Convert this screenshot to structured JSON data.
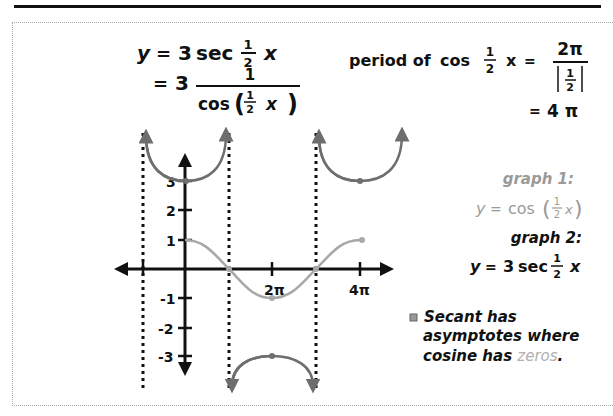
{
  "equations": {
    "main_line1": {
      "lhs": "y",
      "eq": "=",
      "coef": "3",
      "func": "sec",
      "frac_num": "1",
      "frac_den": "2",
      "var": "x"
    },
    "main_line2": {
      "eq": "=",
      "coef": "3",
      "num": "1",
      "den_func": "cos",
      "den_frac_num": "1",
      "den_frac_den": "2",
      "den_var": "x"
    },
    "period": {
      "label": "period of",
      "func": "cos",
      "frac_num": "1",
      "frac_den": "2",
      "var": "x",
      "eq": "=",
      "num": "2π",
      "den_num": "1",
      "den_den": "2",
      "result_eq": "=",
      "result": "4 π"
    }
  },
  "legend": {
    "graph1_label": "graph 1:",
    "graph1_eq": {
      "lhs": "y",
      "eq": "=",
      "func": "cos",
      "frac_num": "1",
      "frac_den": "2",
      "var": "x"
    },
    "graph2_label": "graph 2:",
    "graph2_eq": {
      "lhs": "y",
      "eq": "=",
      "coef": "3",
      "func": "sec",
      "frac_num": "1",
      "frac_den": "2",
      "var": "x"
    }
  },
  "note": {
    "line1": "Secant has",
    "line2": "asymptotes where",
    "line3_a": "cosine has ",
    "line3_b": "zeros",
    "line3_c": "."
  },
  "axes": {
    "y_ticks": [
      "3",
      "2",
      "1",
      "-1",
      "-2",
      "-3"
    ],
    "x_ticks": [
      "2π",
      "4π"
    ]
  },
  "colors": {
    "cosine_curve": "#a8a8a8",
    "secant_curve": "#6e6e6e",
    "axes": "#111111",
    "zeros_text": "#b0b0b0"
  }
}
